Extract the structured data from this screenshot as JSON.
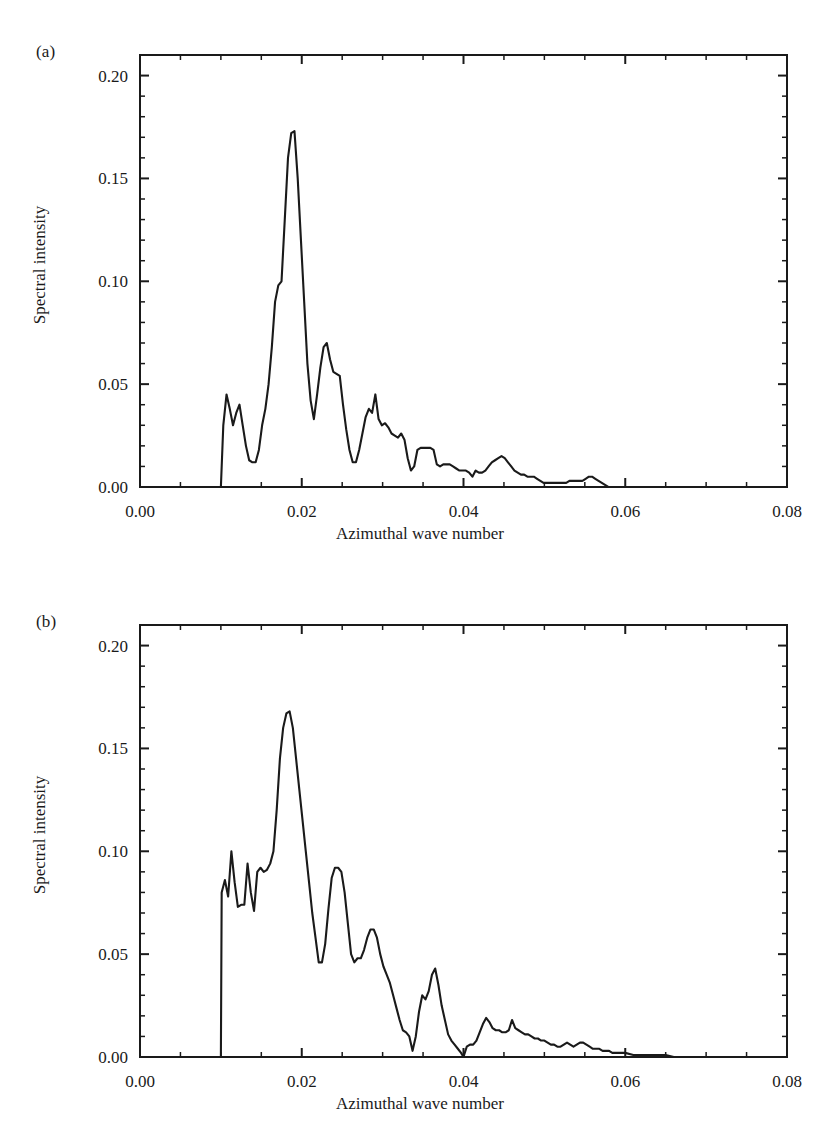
{
  "figure": {
    "panels": [
      {
        "tag": "(a)",
        "ylabel": "Spectral intensity",
        "xlabel": "Azimuthal wave number",
        "xticks": [
          "0.00",
          "0.02",
          "0.04",
          "0.06",
          "0.08"
        ],
        "yticks": [
          "0.00",
          "0.05",
          "0.10",
          "0.15",
          "0.20"
        ]
      },
      {
        "tag": "(b)",
        "ylabel": "Spectral intensity",
        "xlabel": "Azimuthal wave number",
        "xticks": [
          "0.00",
          "0.02",
          "0.04",
          "0.06",
          "0.08"
        ],
        "yticks": [
          "0.00",
          "0.05",
          "0.10",
          "0.15",
          "0.20"
        ]
      }
    ]
  },
  "chart_data": [
    {
      "type": "line",
      "panel": "(a)",
      "title": "",
      "xlabel": "Azimuthal wave number",
      "ylabel": "Spectral intensity",
      "xlim": [
        0.0,
        0.08
      ],
      "ylim": [
        0.0,
        0.21
      ],
      "xticks": [
        0.0,
        0.02,
        0.04,
        0.06,
        0.08
      ],
      "yticks": [
        0.0,
        0.05,
        0.1,
        0.15,
        0.2
      ],
      "minor_tick_step_x": 0.005,
      "minor_tick_step_y": 0.01,
      "grid": false,
      "legend": false,
      "line_color": "#1a1a1a",
      "x": [
        0.0,
        0.003,
        0.006,
        0.009,
        0.01,
        0.0103,
        0.0107,
        0.0111,
        0.0115,
        0.0119,
        0.0123,
        0.0127,
        0.0131,
        0.0135,
        0.0139,
        0.0143,
        0.0147,
        0.0151,
        0.0155,
        0.0159,
        0.0163,
        0.0167,
        0.0171,
        0.0175,
        0.0179,
        0.0183,
        0.0187,
        0.0191,
        0.0195,
        0.0199,
        0.0203,
        0.0207,
        0.0211,
        0.0215,
        0.0219,
        0.0223,
        0.0227,
        0.0231,
        0.0235,
        0.0239,
        0.0243,
        0.0247,
        0.0251,
        0.0255,
        0.0259,
        0.0263,
        0.0267,
        0.0271,
        0.0275,
        0.0279,
        0.0283,
        0.0287,
        0.0291,
        0.0295,
        0.0299,
        0.0303,
        0.0307,
        0.0311,
        0.0315,
        0.0319,
        0.0323,
        0.0327,
        0.0331,
        0.0335,
        0.0339,
        0.0343,
        0.0347,
        0.0351,
        0.0355,
        0.0359,
        0.0363,
        0.0367,
        0.0371,
        0.0375,
        0.0379,
        0.0383,
        0.0387,
        0.0391,
        0.0395,
        0.0399,
        0.0403,
        0.0407,
        0.0411,
        0.0415,
        0.0419,
        0.0423,
        0.0427,
        0.0431,
        0.0435,
        0.0439,
        0.0443,
        0.0447,
        0.0451,
        0.0455,
        0.0459,
        0.0463,
        0.0467,
        0.0471,
        0.0475,
        0.0479,
        0.0483,
        0.0487,
        0.0491,
        0.0495,
        0.0499,
        0.0503,
        0.0507,
        0.0511,
        0.0515,
        0.0519,
        0.0523,
        0.0527,
        0.0531,
        0.0535,
        0.0539,
        0.0543,
        0.0547,
        0.0551,
        0.0555,
        0.0559,
        0.0563,
        0.0567,
        0.0571,
        0.0575,
        0.0579,
        0.0583,
        0.0587,
        0.0591,
        0.06,
        0.062,
        0.065,
        0.07,
        0.075,
        0.08
      ],
      "y": [
        0.0,
        0.0,
        0.0,
        0.0,
        0.0,
        0.03,
        0.045,
        0.038,
        0.03,
        0.036,
        0.04,
        0.03,
        0.02,
        0.013,
        0.012,
        0.012,
        0.018,
        0.03,
        0.038,
        0.05,
        0.068,
        0.09,
        0.098,
        0.1,
        0.13,
        0.16,
        0.172,
        0.173,
        0.15,
        0.12,
        0.09,
        0.06,
        0.042,
        0.033,
        0.045,
        0.058,
        0.068,
        0.07,
        0.062,
        0.056,
        0.055,
        0.054,
        0.04,
        0.028,
        0.018,
        0.012,
        0.012,
        0.018,
        0.026,
        0.034,
        0.038,
        0.036,
        0.045,
        0.033,
        0.03,
        0.031,
        0.029,
        0.026,
        0.025,
        0.024,
        0.026,
        0.023,
        0.014,
        0.008,
        0.01,
        0.018,
        0.019,
        0.019,
        0.019,
        0.019,
        0.018,
        0.011,
        0.01,
        0.011,
        0.011,
        0.011,
        0.01,
        0.009,
        0.008,
        0.008,
        0.008,
        0.007,
        0.005,
        0.008,
        0.007,
        0.007,
        0.008,
        0.01,
        0.012,
        0.013,
        0.014,
        0.015,
        0.014,
        0.012,
        0.01,
        0.008,
        0.007,
        0.006,
        0.006,
        0.005,
        0.005,
        0.005,
        0.004,
        0.003,
        0.002,
        0.002,
        0.002,
        0.002,
        0.002,
        0.002,
        0.002,
        0.002,
        0.003,
        0.003,
        0.003,
        0.003,
        0.003,
        0.004,
        0.005,
        0.005,
        0.004,
        0.003,
        0.002,
        0.001,
        0.0,
        0.0,
        0.0,
        0.0,
        0.0,
        0.0,
        0.0,
        0.0,
        0.0,
        0.0
      ]
    },
    {
      "type": "line",
      "panel": "(b)",
      "title": "",
      "xlabel": "Azimuthal wave number",
      "ylabel": "Spectral intensity",
      "xlim": [
        0.0,
        0.08
      ],
      "ylim": [
        0.0,
        0.21
      ],
      "xticks": [
        0.0,
        0.02,
        0.04,
        0.06,
        0.08
      ],
      "yticks": [
        0.0,
        0.05,
        0.1,
        0.15,
        0.2
      ],
      "minor_tick_step_x": 0.005,
      "minor_tick_step_y": 0.01,
      "grid": false,
      "legend": false,
      "line_color": "#1a1a1a",
      "x": [
        0.0,
        0.003,
        0.006,
        0.009,
        0.01,
        0.0101,
        0.0105,
        0.0109,
        0.0113,
        0.0117,
        0.0121,
        0.0125,
        0.0129,
        0.0133,
        0.0137,
        0.0141,
        0.0145,
        0.0149,
        0.0153,
        0.0157,
        0.0161,
        0.0165,
        0.0169,
        0.0173,
        0.0177,
        0.0181,
        0.0185,
        0.0189,
        0.0193,
        0.0197,
        0.0201,
        0.0205,
        0.0209,
        0.0213,
        0.0217,
        0.0221,
        0.0225,
        0.0229,
        0.0233,
        0.0237,
        0.0241,
        0.0245,
        0.0249,
        0.0253,
        0.0257,
        0.0261,
        0.0265,
        0.0269,
        0.0273,
        0.0277,
        0.0281,
        0.0285,
        0.0289,
        0.0293,
        0.0297,
        0.0301,
        0.0305,
        0.0309,
        0.0313,
        0.0317,
        0.0321,
        0.0325,
        0.0329,
        0.0333,
        0.0337,
        0.0341,
        0.0345,
        0.0349,
        0.0353,
        0.0357,
        0.0361,
        0.0365,
        0.0369,
        0.0373,
        0.0377,
        0.0381,
        0.0385,
        0.0389,
        0.0393,
        0.0397,
        0.04,
        0.0404,
        0.0408,
        0.0412,
        0.0416,
        0.042,
        0.0424,
        0.0428,
        0.0432,
        0.0436,
        0.044,
        0.0444,
        0.0448,
        0.0452,
        0.0456,
        0.046,
        0.0464,
        0.0468,
        0.0472,
        0.0476,
        0.048,
        0.0484,
        0.0488,
        0.0492,
        0.0496,
        0.05,
        0.0504,
        0.0508,
        0.0512,
        0.0516,
        0.052,
        0.0524,
        0.0528,
        0.0532,
        0.0536,
        0.054,
        0.0544,
        0.0548,
        0.0552,
        0.0556,
        0.056,
        0.0564,
        0.0568,
        0.0572,
        0.0576,
        0.058,
        0.0584,
        0.0588,
        0.0592,
        0.0596,
        0.06,
        0.061,
        0.062,
        0.063,
        0.064,
        0.065,
        0.066,
        0.067,
        0.07,
        0.075,
        0.08
      ],
      "y": [
        0.0,
        0.0,
        0.0,
        0.0,
        0.0,
        0.08,
        0.086,
        0.078,
        0.1,
        0.085,
        0.073,
        0.074,
        0.074,
        0.094,
        0.08,
        0.071,
        0.09,
        0.092,
        0.09,
        0.091,
        0.094,
        0.1,
        0.12,
        0.145,
        0.16,
        0.167,
        0.168,
        0.16,
        0.145,
        0.13,
        0.115,
        0.1,
        0.085,
        0.07,
        0.058,
        0.046,
        0.046,
        0.055,
        0.072,
        0.087,
        0.092,
        0.092,
        0.09,
        0.08,
        0.065,
        0.05,
        0.046,
        0.048,
        0.048,
        0.052,
        0.058,
        0.062,
        0.062,
        0.058,
        0.05,
        0.044,
        0.04,
        0.036,
        0.03,
        0.024,
        0.018,
        0.013,
        0.012,
        0.01,
        0.003,
        0.01,
        0.022,
        0.03,
        0.028,
        0.032,
        0.04,
        0.043,
        0.035,
        0.025,
        0.018,
        0.011,
        0.008,
        0.006,
        0.004,
        0.002,
        0.0,
        0.005,
        0.006,
        0.006,
        0.008,
        0.012,
        0.016,
        0.019,
        0.017,
        0.014,
        0.013,
        0.013,
        0.012,
        0.012,
        0.013,
        0.018,
        0.014,
        0.013,
        0.012,
        0.011,
        0.011,
        0.01,
        0.009,
        0.009,
        0.008,
        0.008,
        0.007,
        0.006,
        0.006,
        0.005,
        0.005,
        0.006,
        0.007,
        0.006,
        0.005,
        0.006,
        0.007,
        0.007,
        0.006,
        0.005,
        0.004,
        0.004,
        0.004,
        0.003,
        0.003,
        0.003,
        0.002,
        0.002,
        0.002,
        0.002,
        0.002,
        0.001,
        0.001,
        0.001,
        0.001,
        0.001,
        0.0,
        0.0,
        0.0,
        0.0,
        0.0
      ]
    }
  ]
}
